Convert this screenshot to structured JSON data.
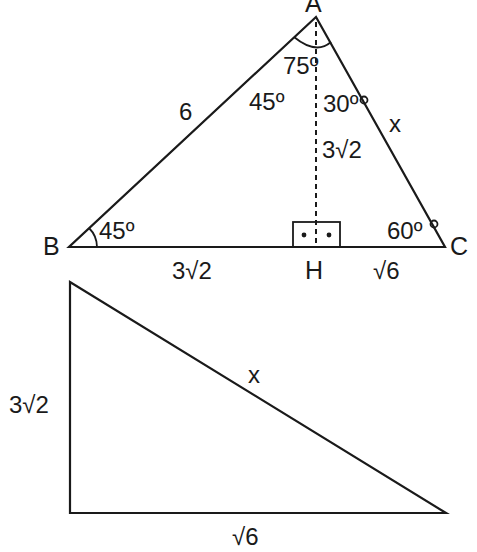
{
  "diagram": {
    "triangle_abc": {
      "vertices": {
        "A": "A",
        "B": "B",
        "C": "C",
        "H": "H"
      },
      "sides": {
        "AB": "6",
        "AC": "x",
        "AH": "3√2",
        "BH": "3√2",
        "HC": "√6"
      },
      "angles": {
        "A_total": "75º",
        "BAH": "45º",
        "HAC": "30º",
        "B": "45º",
        "C": "60º"
      },
      "right_angle_marker": "• •"
    },
    "triangle_ahc": {
      "sides": {
        "vertical_leg": "3√2",
        "horizontal_leg": "√6",
        "hypotenuse": "x"
      }
    }
  }
}
